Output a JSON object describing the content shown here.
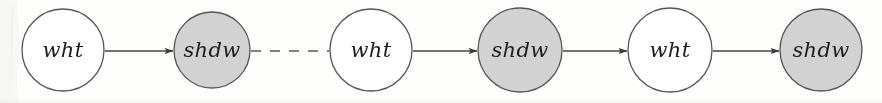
{
  "figure": {
    "name": "node-chain-diagram",
    "width": 882,
    "height": 103,
    "background_color": "#fdfdfc",
    "node_stroke_color": "#555555",
    "edge_color": "#444444",
    "white_fill_color": "#ffffff",
    "shadow_fill_color": "#d2d2d2"
  },
  "nodes": [
    {
      "id": "n1",
      "label": "wht",
      "cx": 63,
      "cy": 50,
      "r": 41,
      "fill": "#ffffff",
      "kind": "white"
    },
    {
      "id": "n2",
      "label": "shdw",
      "cx": 212,
      "cy": 50,
      "r": 38,
      "fill": "#d2d2d2",
      "kind": "shaded"
    },
    {
      "id": "n3",
      "label": "wht",
      "cx": 371,
      "cy": 50,
      "r": 41,
      "fill": "#ffffff",
      "kind": "white"
    },
    {
      "id": "n4",
      "label": "shdw",
      "cx": 520,
      "cy": 50,
      "r": 42,
      "fill": "#d2d2d2",
      "kind": "shaded"
    },
    {
      "id": "n5",
      "label": "wht",
      "cx": 670,
      "cy": 50,
      "r": 42,
      "fill": "#ffffff",
      "kind": "white"
    },
    {
      "id": "n6",
      "label": "shdw",
      "cx": 821,
      "cy": 50,
      "r": 41,
      "fill": "#d2d2d2",
      "kind": "shaded"
    }
  ],
  "edges": [
    {
      "id": "e1",
      "from": "n1",
      "to": "n2",
      "x1": 105,
      "x2": 173,
      "y": 51,
      "style": "solid",
      "arrowhead": true
    },
    {
      "id": "e2",
      "from": "n2",
      "to": "n3",
      "x1": 251,
      "x2": 329,
      "y": 51,
      "style": "dashed",
      "arrowhead": false
    },
    {
      "id": "e3",
      "from": "n3",
      "to": "n4",
      "x1": 413,
      "x2": 477,
      "y": 51,
      "style": "solid",
      "arrowhead": true
    },
    {
      "id": "e4",
      "from": "n4",
      "to": "n5",
      "x1": 563,
      "x2": 627,
      "y": 51,
      "style": "solid",
      "arrowhead": true
    },
    {
      "id": "e5",
      "from": "n5",
      "to": "n6",
      "x1": 713,
      "x2": 779,
      "y": 51,
      "style": "solid",
      "arrowhead": true
    }
  ]
}
